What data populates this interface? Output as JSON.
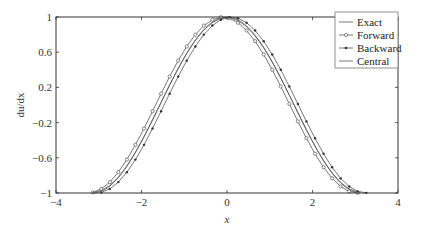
{
  "chart_data": {
    "type": "line",
    "title": "",
    "xlabel": "x",
    "ylabel": "du/dx",
    "xlim": [
      -4,
      4
    ],
    "ylim": [
      -1,
      1
    ],
    "xticks": [
      -4,
      -2,
      0,
      2,
      4
    ],
    "xtick_labels": [
      "−4",
      "−2",
      "0",
      "2",
      "4"
    ],
    "yticks": [
      1,
      0.6,
      0.2,
      -0.2,
      -0.6,
      -1
    ],
    "ytick_labels": [
      "1",
      "0.6",
      "0.2",
      "−0.2",
      "−0.6",
      "−1"
    ],
    "grid": false,
    "legend_position": "upper right",
    "step_h": 0.2,
    "x": [
      -3.1416,
      -2.9416,
      -2.7416,
      -2.5416,
      -2.3416,
      -2.1416,
      -1.9416,
      -1.7416,
      -1.5416,
      -1.3416,
      -1.1416,
      -0.9416,
      -0.7416,
      -0.5416,
      -0.3416,
      -0.1416,
      0.0584,
      0.2584,
      0.4584,
      0.6584,
      0.8584,
      1.0584,
      1.2584,
      1.4584,
      1.6584,
      1.8584,
      2.0584,
      2.2584,
      2.4584,
      2.6584,
      2.8584,
      3.0584
    ],
    "series": [
      {
        "name": "Exact",
        "marker": "none",
        "formula": "cos(x)"
      },
      {
        "name": "Forward",
        "marker": "circle",
        "formula": "(sin(x+h)-sin(x))/h"
      },
      {
        "name": "Backward",
        "marker": "dot",
        "formula": "(sin(x)-sin(x-h))/h"
      },
      {
        "name": "Central",
        "marker": "none",
        "formula": "(sin(x+h)-sin(x-h))/(2h)"
      }
    ]
  },
  "legend": {
    "items": [
      "Exact",
      "Forward",
      "Backward",
      "Central"
    ]
  },
  "colors": {
    "axis": "#333333",
    "line": "#555555",
    "legend_border": "#777777"
  }
}
